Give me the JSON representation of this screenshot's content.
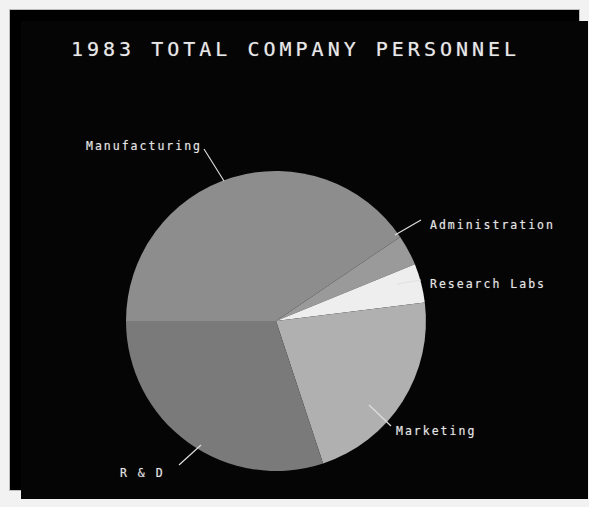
{
  "chart_data": {
    "type": "pie",
    "title": "1983 TOTAL COMPANY PERSONNEL",
    "xlabel": "",
    "ylabel": "",
    "legend_position": "callout-labels",
    "grid": false,
    "categories": [
      "Manufacturing",
      "Administration",
      "Research Labs",
      "Marketing",
      "R & D"
    ],
    "values": [
      40.5,
      3.3,
      4.2,
      21.9,
      30.1
    ],
    "units": "percent of total personnel",
    "slices": [
      {
        "label": "Manufacturing",
        "value": 40.5,
        "color": "#8d8d8d",
        "start_angle_deg": 180.0,
        "end_angle_deg": 325.9
      },
      {
        "label": "Administration",
        "value": 3.3,
        "color": "#9a9a9a",
        "start_angle_deg": 325.9,
        "end_angle_deg": 337.8
      },
      {
        "label": "Research Labs",
        "value": 4.2,
        "color": "#eeeeee",
        "start_angle_deg": 337.8,
        "end_angle_deg": 352.9
      },
      {
        "label": "Marketing",
        "value": 21.9,
        "color": "#b0b0b0",
        "start_angle_deg": 352.9,
        "end_angle_deg": 431.7
      },
      {
        "label": "R & D",
        "value": 30.1,
        "color": "#7a7a7a",
        "start_angle_deg": 431.7,
        "end_angle_deg": 540.0
      }
    ]
  },
  "display": {
    "title": "1983 TOTAL COMPANY PERSONNEL",
    "background_color": "#050505",
    "text_color": "#e4e4e4",
    "border_color": "#bdbdbd"
  },
  "labels": {
    "manufacturing": "Manufacturing",
    "administration": "Administration",
    "research_labs": "Research Labs",
    "marketing": "Marketing",
    "rd": "R & D"
  }
}
